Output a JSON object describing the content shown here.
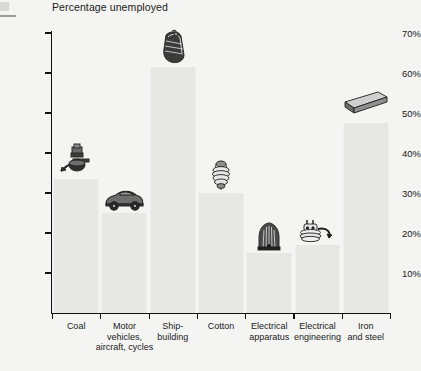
{
  "chart_data": {
    "type": "bar",
    "title": "Percentage unemployed",
    "xlabel": "",
    "ylabel": "",
    "ylim": [
      0,
      70
    ],
    "ytick_values": [
      10,
      20,
      30,
      40,
      50,
      60,
      70
    ],
    "ytick_labels": [
      "10%",
      "20%",
      "30%",
      "40%",
      "50%",
      "60%",
      "70%"
    ],
    "grid": false,
    "legend": "none",
    "categories": [
      "Coal",
      "Motor vehicles, aircraft, cycles",
      "Ship-building",
      "Cotton",
      "Electrical apparatus",
      "Electrical engineering",
      "Iron and steel"
    ],
    "values": [
      33.5,
      25,
      61.5,
      30,
      15,
      17,
      47.5
    ],
    "series": [
      {
        "name": "Percentage unemployed",
        "values": [
          33.5,
          25,
          61.5,
          30,
          15,
          17,
          47.5
        ]
      }
    ],
    "annotations": [
      {
        "category": "Coal",
        "icon": "pickaxe-and-miners-lamp-icon"
      },
      {
        "category": "Motor vehicles, aircraft, cycles",
        "icon": "car-icon"
      },
      {
        "category": "Ship-building",
        "icon": "ship-hull-icon"
      },
      {
        "category": "Cotton",
        "icon": "cotton-bobbin-icon"
      },
      {
        "category": "Electrical apparatus",
        "icon": "electric-heater-icon"
      },
      {
        "category": "Electrical engineering",
        "icon": "electric-plug-and-cable-icon"
      },
      {
        "category": "Iron and steel",
        "icon": "steel-girder-icon"
      }
    ]
  },
  "chart": {
    "title": "Percentage unemployed",
    "y_ticks": [
      {
        "label": "70%",
        "value": 70
      },
      {
        "label": "60%",
        "value": 60
      },
      {
        "label": "50%",
        "value": 50
      },
      {
        "label": "40%",
        "value": 40
      },
      {
        "label": "30%",
        "value": 30
      },
      {
        "label": "20%",
        "value": 20
      },
      {
        "label": "10%",
        "value": 10
      }
    ],
    "bars": [
      {
        "label_line1": "Coal",
        "label_line2": "",
        "label_line3": "",
        "value": 33.5,
        "icon": "pickaxe-and-miners-lamp-icon"
      },
      {
        "label_line1": "Motor",
        "label_line2": "vehicles,",
        "label_line3": "aircraft, cycles",
        "value": 25,
        "icon": "car-icon"
      },
      {
        "label_line1": "Ship-",
        "label_line2": "building",
        "label_line3": "",
        "value": 61.5,
        "icon": "ship-hull-icon"
      },
      {
        "label_line1": "Cotton",
        "label_line2": "",
        "label_line3": "",
        "value": 30,
        "icon": "cotton-bobbin-icon"
      },
      {
        "label_line1": "Electrical",
        "label_line2": "apparatus",
        "label_line3": "",
        "value": 15,
        "icon": "electric-heater-icon"
      },
      {
        "label_line1": "Electrical",
        "label_line2": "engineering",
        "label_line3": "",
        "value": 17,
        "icon": "electric-plug-and-cable-icon"
      },
      {
        "label_line1": "Iron",
        "label_line2": "and steel",
        "label_line3": "",
        "value": 47.5,
        "icon": "steel-girder-icon"
      }
    ],
    "colors": {
      "background": "#f4f4f2",
      "bar_fill": "#e7e7e4",
      "axis": "#111111",
      "text": "#1a1a1a"
    }
  }
}
